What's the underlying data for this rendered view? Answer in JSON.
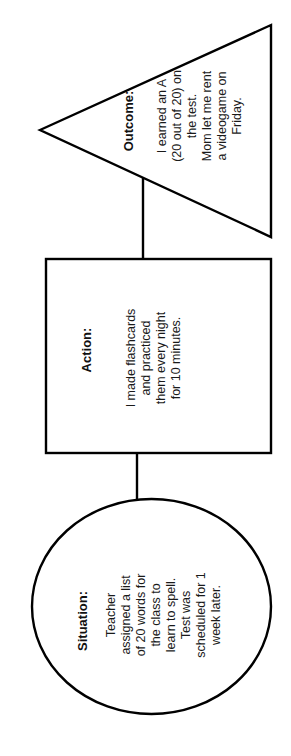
{
  "diagram": {
    "type": "situation-action-outcome flow",
    "orientation": "rotated 90° counter-clockwise",
    "colors": {
      "stroke": "#000000",
      "fill": "#ffffff",
      "text": "#111111"
    },
    "nodes": [
      {
        "id": "outcome",
        "shape": "triangle",
        "heading": "Outcome:",
        "lines": [
          "I earned an A",
          "(20 out of 20) on",
          "the test.",
          "Mom let me rent",
          "a videogame on",
          "Friday."
        ]
      },
      {
        "id": "action",
        "shape": "rectangle",
        "heading": "Action:",
        "lines": [
          "I made flashcards",
          "and practiced",
          "them every night",
          "for 10 minutes."
        ]
      },
      {
        "id": "situation",
        "shape": "ellipse",
        "heading": "Situation:",
        "lines": [
          "Teacher",
          "assigned a list",
          "of 20 words for",
          "the class to",
          "learn to spell.",
          "Test was",
          "scheduled for 1",
          "week later."
        ]
      }
    ],
    "edges": [
      {
        "from": "situation",
        "to": "action"
      },
      {
        "from": "action",
        "to": "outcome"
      }
    ]
  }
}
